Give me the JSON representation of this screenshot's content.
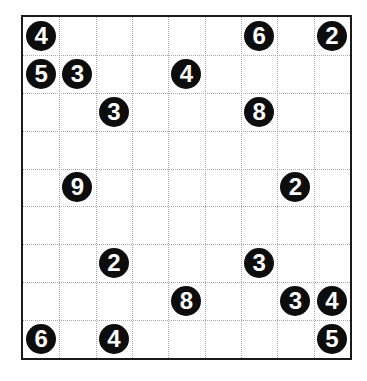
{
  "puzzle": {
    "rows": 9,
    "cols": 9,
    "colors": {
      "clue_fill": "#0d0d0d",
      "clue_text": "#ffffff",
      "border": "#1a1a1a",
      "grid_line": "#a8a8a8"
    },
    "clues": [
      {
        "row": 0,
        "col": 0,
        "value": "4"
      },
      {
        "row": 0,
        "col": 6,
        "value": "6"
      },
      {
        "row": 0,
        "col": 8,
        "value": "2"
      },
      {
        "row": 1,
        "col": 0,
        "value": "5"
      },
      {
        "row": 1,
        "col": 1,
        "value": "3"
      },
      {
        "row": 1,
        "col": 4,
        "value": "4"
      },
      {
        "row": 2,
        "col": 2,
        "value": "3"
      },
      {
        "row": 2,
        "col": 6,
        "value": "8"
      },
      {
        "row": 4,
        "col": 1,
        "value": "9"
      },
      {
        "row": 4,
        "col": 7,
        "value": "2"
      },
      {
        "row": 6,
        "col": 2,
        "value": "2"
      },
      {
        "row": 6,
        "col": 6,
        "value": "3"
      },
      {
        "row": 7,
        "col": 4,
        "value": "8"
      },
      {
        "row": 7,
        "col": 7,
        "value": "3"
      },
      {
        "row": 7,
        "col": 8,
        "value": "4"
      },
      {
        "row": 8,
        "col": 0,
        "value": "6"
      },
      {
        "row": 8,
        "col": 2,
        "value": "4"
      },
      {
        "row": 8,
        "col": 8,
        "value": "5"
      }
    ]
  }
}
